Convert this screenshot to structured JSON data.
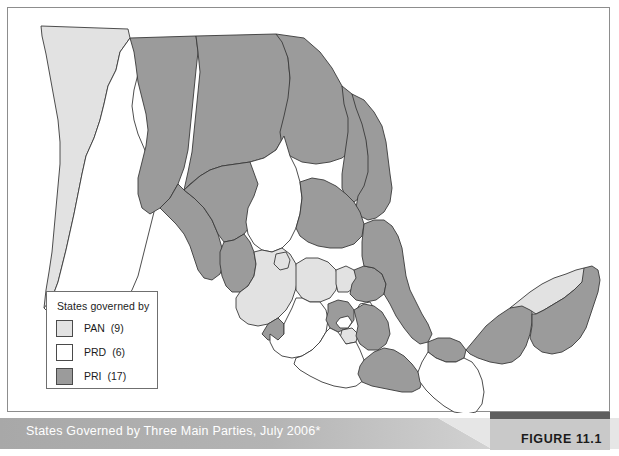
{
  "figure": {
    "caption": "States Governed by Three Main Parties, July 2006*",
    "label": "FIGURE 11.1"
  },
  "legend": {
    "title": "States governed by",
    "items": [
      {
        "party": "PAN",
        "count": "(9)",
        "color": "#e2e2e2"
      },
      {
        "party": "PRD",
        "count": "(6)",
        "color": "#ffffff"
      },
      {
        "party": "PRI",
        "count": "(17)",
        "color": "#9b9b9b"
      }
    ]
  },
  "map": {
    "title": "Map of Mexico by governing party",
    "colors": {
      "pan": "#e2e2e2",
      "prd": "#ffffff",
      "pri": "#9b9b9b",
      "outline": "#3a3a3a",
      "sea": "#ffffff"
    },
    "states": [
      {
        "name": "Baja California",
        "party": "PAN"
      },
      {
        "name": "Baja California Sur",
        "party": "PRD"
      },
      {
        "name": "Sonora",
        "party": "PRI"
      },
      {
        "name": "Chihuahua",
        "party": "PRI"
      },
      {
        "name": "Coahuila",
        "party": "PRI"
      },
      {
        "name": "Nuevo Leon",
        "party": "PRI"
      },
      {
        "name": "Tamaulipas",
        "party": "PRI"
      },
      {
        "name": "Sinaloa",
        "party": "PRI"
      },
      {
        "name": "Durango",
        "party": "PRI"
      },
      {
        "name": "Zacatecas",
        "party": "PRD"
      },
      {
        "name": "San Luis Potosi",
        "party": "PRI"
      },
      {
        "name": "Nayarit",
        "party": "PRI"
      },
      {
        "name": "Jalisco",
        "party": "PAN"
      },
      {
        "name": "Aguascalientes",
        "party": "PAN"
      },
      {
        "name": "Guanajuato",
        "party": "PAN"
      },
      {
        "name": "Queretaro",
        "party": "PAN"
      },
      {
        "name": "Hidalgo",
        "party": "PRI"
      },
      {
        "name": "Veracruz",
        "party": "PRI"
      },
      {
        "name": "Colima",
        "party": "PRI"
      },
      {
        "name": "Michoacan",
        "party": "PRD"
      },
      {
        "name": "Mexico State",
        "party": "PRI"
      },
      {
        "name": "Distrito Federal",
        "party": "PRD"
      },
      {
        "name": "Morelos",
        "party": "PAN"
      },
      {
        "name": "Tlaxcala",
        "party": "PRD"
      },
      {
        "name": "Puebla",
        "party": "PRI"
      },
      {
        "name": "Guerrero",
        "party": "PRD"
      },
      {
        "name": "Oaxaca",
        "party": "PRI"
      },
      {
        "name": "Tabasco",
        "party": "PRI"
      },
      {
        "name": "Chiapas",
        "party": "PRD"
      },
      {
        "name": "Campeche",
        "party": "PRI"
      },
      {
        "name": "Yucatan",
        "party": "PAN"
      },
      {
        "name": "Quintana Roo",
        "party": "PRI"
      }
    ]
  }
}
